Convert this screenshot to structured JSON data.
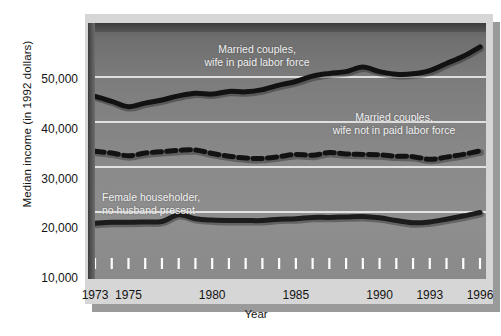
{
  "chart_data": {
    "type": "line",
    "title": "",
    "xlabel": "Year",
    "ylabel": "Median income (in 1992 dollars)",
    "xlim": [
      1973,
      1996
    ],
    "ylim": [
      10000,
      60000
    ],
    "grid": "horizontal",
    "legend_position": "inline-annotations",
    "y_ticklabels": [
      "50,000",
      "40,000",
      "30,000",
      "20,000",
      "10,000"
    ],
    "y_tickvalues": [
      50000,
      40000,
      30000,
      20000,
      10000
    ],
    "x_ticklabels": [
      "1973",
      "1975",
      "1980",
      "1985",
      "1990",
      "1993",
      "1996"
    ],
    "x_tickvalues": [
      1973,
      1975,
      1980,
      1985,
      1990,
      1993,
      1996
    ],
    "x_minor_ticks": [
      1973,
      1974,
      1975,
      1976,
      1977,
      1978,
      1979,
      1980,
      1981,
      1982,
      1983,
      1984,
      1985,
      1986,
      1987,
      1988,
      1989,
      1990,
      1991,
      1992,
      1993,
      1994,
      1995,
      1996
    ],
    "x": [
      1973,
      1974,
      1975,
      1976,
      1977,
      1978,
      1979,
      1980,
      1981,
      1982,
      1983,
      1984,
      1985,
      1986,
      1987,
      1988,
      1989,
      1990,
      1991,
      1992,
      1993,
      1994,
      1995,
      1996
    ],
    "series": [
      {
        "name": "Married couples, wife in paid labor force",
        "style": "solid",
        "color": "#121212",
        "values": [
          45700,
          44600,
          43400,
          44200,
          44900,
          45800,
          46400,
          46200,
          46800,
          46700,
          47200,
          48200,
          49000,
          50200,
          50800,
          51200,
          52200,
          51200,
          50600,
          50700,
          51400,
          53000,
          54600,
          56700
        ]
      },
      {
        "name": "Married couples, wife not in paid labor force",
        "style": "dashed",
        "color": "#121212",
        "values": [
          33500,
          33100,
          32500,
          33100,
          33400,
          33700,
          33800,
          33000,
          32400,
          32000,
          31900,
          32300,
          32800,
          32600,
          33200,
          32900,
          32800,
          32700,
          32400,
          32300,
          31700,
          32200,
          32800,
          33600
        ]
      },
      {
        "name": "Female householder, no husband present",
        "style": "solid",
        "color": "#1c1c1c",
        "values": [
          17500,
          17700,
          17700,
          17800,
          17900,
          19400,
          18500,
          18200,
          18100,
          18100,
          18100,
          18400,
          18500,
          18800,
          18800,
          18900,
          19000,
          18700,
          18100,
          17600,
          17800,
          18400,
          19100,
          19900
        ]
      }
    ],
    "annotations": [
      {
        "id": "annot-married-wife-working",
        "line1": "Married couples,",
        "line2": "wife in paid labor force"
      },
      {
        "id": "annot-married-wife-not-working",
        "line1": "Married couples,",
        "line2": "wife not in paid labor force"
      },
      {
        "id": "annot-female-householder",
        "line1": "Female householder,",
        "line2": "no husband present"
      }
    ],
    "colors": {
      "plot_background_top": "#6f6f6f",
      "plot_background_bottom": "#8e8e8e",
      "gridline": "#ffffff",
      "series_line": "#121212",
      "mount": "#d6d6d6",
      "shadow": "#9a9a9a",
      "text": "#141414"
    }
  }
}
